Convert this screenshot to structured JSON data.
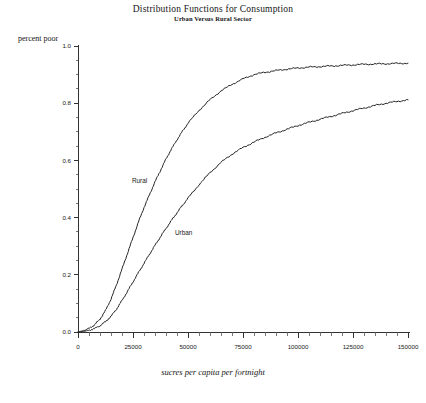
{
  "chart_data": {
    "type": "line",
    "title": "Distribution Functions for Consumption",
    "subtitle": "Urban Versus Rural Sector",
    "xlabel": "sucres per capita per fortnight",
    "ylabel": "percent poor",
    "xlim": [
      0,
      150000
    ],
    "ylim": [
      0,
      1.0
    ],
    "grid": false,
    "legend_position": "inline-annotation",
    "xticks": [
      0,
      25000,
      50000,
      75000,
      100000,
      125000,
      150000
    ],
    "xtick_labels": [
      "0",
      "25000",
      "50000",
      "75000",
      "100000",
      "125000",
      "150000"
    ],
    "yticks": [
      0.0,
      0.2,
      0.4,
      0.6,
      0.8,
      1.0
    ],
    "ytick_labels": [
      "0.0",
      "0.2",
      "0.4",
      "0.6",
      "0.8",
      "1.0"
    ],
    "x": [
      0,
      2500,
      5000,
      7500,
      10000,
      12500,
      15000,
      17500,
      20000,
      22500,
      25000,
      27500,
      30000,
      32500,
      35000,
      37500,
      40000,
      42500,
      45000,
      47500,
      50000,
      55000,
      60000,
      65000,
      70000,
      75000,
      80000,
      85000,
      90000,
      95000,
      100000,
      105000,
      110000,
      115000,
      120000,
      125000,
      130000,
      135000,
      140000,
      145000,
      150000
    ],
    "series": [
      {
        "name": "Rural",
        "label": "Rural",
        "values": [
          0.0,
          0.005,
          0.012,
          0.025,
          0.045,
          0.075,
          0.115,
          0.165,
          0.22,
          0.275,
          0.33,
          0.385,
          0.435,
          0.48,
          0.525,
          0.565,
          0.605,
          0.64,
          0.672,
          0.702,
          0.73,
          0.775,
          0.812,
          0.843,
          0.866,
          0.885,
          0.9,
          0.908,
          0.914,
          0.919,
          0.923,
          0.926,
          0.928,
          0.93,
          0.932,
          0.934,
          0.936,
          0.937,
          0.938,
          0.939,
          0.94
        ]
      },
      {
        "name": "Urban",
        "label": "Urban",
        "values": [
          0.0,
          0.002,
          0.006,
          0.012,
          0.022,
          0.036,
          0.055,
          0.08,
          0.11,
          0.142,
          0.175,
          0.208,
          0.24,
          0.272,
          0.303,
          0.333,
          0.362,
          0.39,
          0.417,
          0.443,
          0.468,
          0.515,
          0.557,
          0.593,
          0.622,
          0.645,
          0.664,
          0.681,
          0.696,
          0.709,
          0.722,
          0.733,
          0.744,
          0.754,
          0.764,
          0.774,
          0.783,
          0.792,
          0.8,
          0.806,
          0.812
        ]
      }
    ],
    "annotations": [
      {
        "text": "Rural",
        "x": 28000,
        "y": 0.52
      },
      {
        "text": "Urban",
        "x": 48000,
        "y": 0.34
      }
    ]
  }
}
